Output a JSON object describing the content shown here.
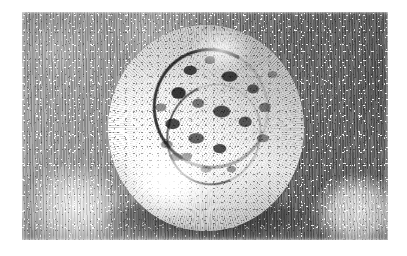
{
  "image": {
    "title": "Engraved sphere on hatched ground",
    "domain": "Natural-Image",
    "medium": "pencil / engraving style grayscale illustration",
    "canvas": {
      "width": 407,
      "height": 256
    },
    "paper_margin": {
      "left": 22,
      "top": 12,
      "right": 19,
      "bottom": 16,
      "color": "#ffffff"
    },
    "palette": {
      "paper_white": "#ffffff",
      "highlight": "#fafafa",
      "light_gray": "#dcdcdc",
      "mid_gray": "#9b9b9b",
      "dark_gray": "#636363",
      "shadow_black": "#1a1a1a"
    },
    "background": {
      "name": "mottled hatched ground",
      "description": "vertical pencil hatching over soft cloudy gray blobs, darker toward the right edge",
      "hatching_direction": "vertical",
      "blobs": [
        {
          "name": "light-blob-bottom-left",
          "x_pct": 14,
          "y_pct": 86,
          "tone": "light"
        },
        {
          "name": "light-blob-bottom-right",
          "x_pct": 92,
          "y_pct": 88,
          "tone": "light"
        },
        {
          "name": "mid-blob-top-left",
          "x_pct": 8,
          "y_pct": 16,
          "tone": "medium"
        },
        {
          "name": "mid-blob-top-center",
          "x_pct": 34,
          "y_pct": 10,
          "tone": "medium"
        },
        {
          "name": "dark-field-right",
          "x_pct": 100,
          "y_pct": 34,
          "tone": "dark"
        },
        {
          "name": "dark-field-top-right",
          "x_pct": 78,
          "y_pct": 14,
          "tone": "dark"
        }
      ]
    },
    "subject": {
      "name": "textured sphere",
      "description": "bright spherical form with a crinkled, cratered floret mass across its upper and central face; smooth luminous lower-left rind; dark cast shadow along the lower rim",
      "center": {
        "x": 205,
        "y": 128
      },
      "diameter": {
        "width": 196,
        "height": 206
      },
      "lighting": "light source lower-left, shadow upper-right and along bottom edge",
      "features": [
        {
          "name": "floret-mass",
          "position": "upper-center-right",
          "tone": "dark mottled"
        },
        {
          "name": "dark-crescent-arc",
          "position": "upper-left of floret mass",
          "tone": "near black"
        },
        {
          "name": "smooth-rind",
          "position": "lower-left",
          "tone": "bright white"
        },
        {
          "name": "rim-shadow",
          "position": "bottom edge",
          "tone": "black"
        },
        {
          "name": "radial-fibres",
          "position": "outer rind",
          "tone": "fine gray strokes"
        }
      ]
    }
  }
}
